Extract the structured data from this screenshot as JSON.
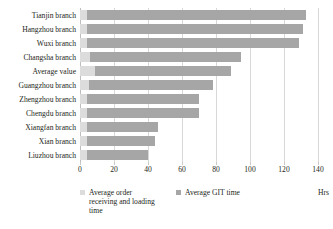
{
  "chart_data": {
    "type": "bar",
    "orientation": "horizontal",
    "stacked": true,
    "title": "",
    "xlabel": "Hrs",
    "ylabel": "",
    "xlim": [
      0,
      140
    ],
    "grid": true,
    "legend_position": "bottom",
    "categories": [
      "Tianjin branch",
      "Hangzhou branch",
      "Wuxi branch",
      "Changsha branch",
      "Average value",
      "Guangzhou branch",
      "Zhengzhou branch",
      "Chengdu branch",
      "Xiangfan branch",
      "Xian branch",
      "Liuzhou branch"
    ],
    "series": [
      {
        "name": "Average order receiving and loading time",
        "color": "#dcdcdc",
        "values": [
          4,
          4,
          4,
          6,
          9,
          5,
          4,
          4,
          4,
          4,
          4
        ]
      },
      {
        "name": "Average GIT time",
        "color": "#a6a6a6",
        "values": [
          129,
          127,
          125,
          89,
          80,
          73,
          66,
          66,
          42,
          40,
          36
        ]
      }
    ],
    "totals": [
      133,
      131,
      129,
      95,
      89,
      78,
      70,
      70,
      46,
      44,
      40
    ],
    "xticks": [
      0,
      20,
      40,
      60,
      80,
      100,
      120,
      140
    ],
    "xticklabels": [
      "0",
      "20",
      "40",
      "60",
      "80",
      "100",
      "120",
      "140"
    ]
  },
  "legend": {
    "items": [
      {
        "label": "Average order receiving and loading time",
        "color": "#dcdcdc"
      },
      {
        "label": "Average GIT time",
        "color": "#a6a6a6"
      }
    ],
    "unit_label": "Hrs"
  }
}
